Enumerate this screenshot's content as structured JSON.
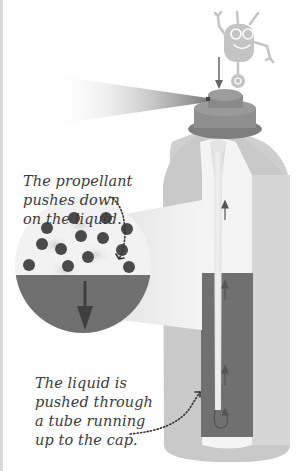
{
  "diagram": {
    "captions": {
      "propellant": {
        "lines": [
          "The propellant",
          "pushes down",
          "on the liquid."
        ]
      },
      "liquid": {
        "lines": [
          "The liquid is",
          "pushed through",
          "a tube running",
          "up to the cap."
        ]
      }
    },
    "elements": {
      "mascot": "robot-mascot",
      "spray": "spray-mist",
      "nozzle": "spray-cap",
      "can": "can-body",
      "tube": "dip-tube",
      "liquid": "liquid-fill",
      "magnifier": "propellant-magnifier"
    },
    "colors": {
      "can_body": "#c9c9c9",
      "can_highlight": "#d8d8d8",
      "cap": "#8f8f8f",
      "cap_dark": "#7a7a7a",
      "liquid": "#707070",
      "gas_particles": "#4a4a4a",
      "interior": "#f2f2f2",
      "robot": "#c4c4c4",
      "arrow": "#555555",
      "text": "#3a3a3a"
    }
  }
}
